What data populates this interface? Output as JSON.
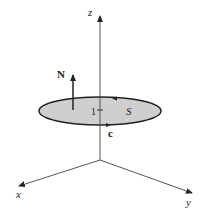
{
  "diagram": {
    "type": "3d-axes-surface",
    "axes": {
      "x_label": "x",
      "y_label": "y",
      "z_label": "z"
    },
    "surface": {
      "label": "S",
      "fill": "#cfcfcf",
      "stroke": "#222222"
    },
    "normal_vector": {
      "label": "N"
    },
    "boundary_curve": {
      "label": "c"
    },
    "height_tick": {
      "label": "1"
    }
  }
}
